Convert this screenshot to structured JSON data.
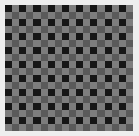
{
  "image": {
    "description": "checkerboard test pattern",
    "rows": 18,
    "cols": 18,
    "colors": {
      "border": "#eeeeee",
      "black": "#161616",
      "light_gray": "#7d7d7d",
      "dark_gray": "#5a5a5a"
    }
  }
}
